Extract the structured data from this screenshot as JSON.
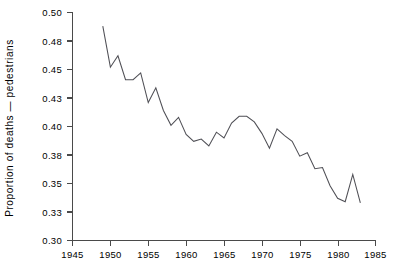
{
  "chart_data": {
    "type": "line",
    "title": "",
    "xlabel": "",
    "ylabel": "Proportion of deaths — pedestrians",
    "xlim": [
      1945,
      1985
    ],
    "ylim": [
      0.3,
      0.5
    ],
    "grid": false,
    "legend": null,
    "xticks": [
      1945,
      1950,
      1955,
      1960,
      1965,
      1970,
      1975,
      1980,
      1985
    ],
    "xtick_labels": [
      "1945",
      "1950",
      "1955",
      "1960",
      "1965",
      "1970",
      "1975",
      "1980",
      "1985"
    ],
    "yticks": [
      0.3,
      0.33,
      0.35,
      0.38,
      0.4,
      0.43,
      0.45,
      0.48,
      0.5
    ],
    "ytick_labels": [
      "0.30",
      "0.33",
      "0.35",
      "0.38",
      "0.40",
      "0.43",
      "0.45",
      "0.48",
      "0.50"
    ],
    "series": [
      {
        "name": "Proportion of deaths - pedestrians",
        "color": "#4f4f55",
        "x": [
          1949,
          1950,
          1951,
          1952,
          1953,
          1954,
          1955,
          1956,
          1957,
          1958,
          1959,
          1960,
          1961,
          1962,
          1963,
          1964,
          1965,
          1966,
          1967,
          1968,
          1969,
          1970,
          1971,
          1972,
          1973,
          1974,
          1975,
          1976,
          1977,
          1978,
          1979,
          1980,
          1981,
          1982,
          1983
        ],
        "y": [
          0.488,
          0.452,
          0.462,
          0.441,
          0.441,
          0.447,
          0.421,
          0.434,
          0.414,
          0.401,
          0.408,
          0.393,
          0.387,
          0.389,
          0.383,
          0.395,
          0.39,
          0.403,
          0.409,
          0.409,
          0.404,
          0.394,
          0.381,
          0.398,
          0.392,
          0.387,
          0.374,
          0.377,
          0.363,
          0.364,
          0.348,
          0.337,
          0.334,
          0.358,
          0.333
        ]
      }
    ]
  },
  "figure": {
    "background_color": "#ffffff",
    "axis_color": "#4a4a4a",
    "line_color": "#4f4f55"
  }
}
